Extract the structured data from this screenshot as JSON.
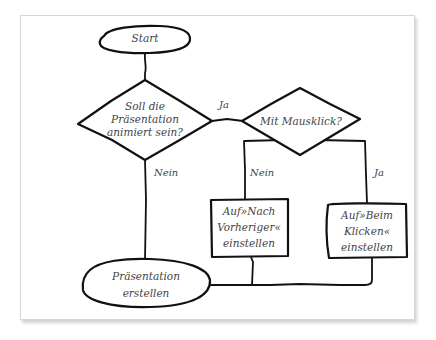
{
  "diagram": {
    "type": "flowchart",
    "colors": {
      "stroke": "#111111",
      "text": "#444444",
      "background": "#ffffff",
      "frame_border": "#d6d6d6"
    },
    "nodes": {
      "start": {
        "shape": "terminal",
        "label": "Start"
      },
      "decision_animated": {
        "shape": "decision",
        "lines": [
          "Soll die",
          "Präsentation",
          "animiert sein?"
        ]
      },
      "decision_mouseclick": {
        "shape": "decision",
        "label": "Mit Mausklick?"
      },
      "process_after_previous": {
        "shape": "process",
        "lines": [
          "Auf»Nach",
          "Vorheriger«",
          "einstellen"
        ]
      },
      "process_on_click": {
        "shape": "process",
        "lines": [
          "Auf»Beim",
          "Klicken«",
          "einstellen"
        ]
      },
      "end": {
        "shape": "terminal",
        "lines": [
          "Präsentation",
          "erstellen"
        ]
      }
    },
    "edges": [
      {
        "from": "start",
        "to": "decision_animated",
        "label": ""
      },
      {
        "from": "decision_animated",
        "to": "decision_mouseclick",
        "label": "Ja"
      },
      {
        "from": "decision_animated",
        "to": "end",
        "label": "Nein"
      },
      {
        "from": "decision_mouseclick",
        "to": "process_after_previous",
        "label": "Nein"
      },
      {
        "from": "decision_mouseclick",
        "to": "process_on_click",
        "label": "Ja"
      },
      {
        "from": "process_after_previous",
        "to": "end",
        "label": ""
      },
      {
        "from": "process_on_click",
        "to": "end",
        "label": ""
      }
    ]
  }
}
